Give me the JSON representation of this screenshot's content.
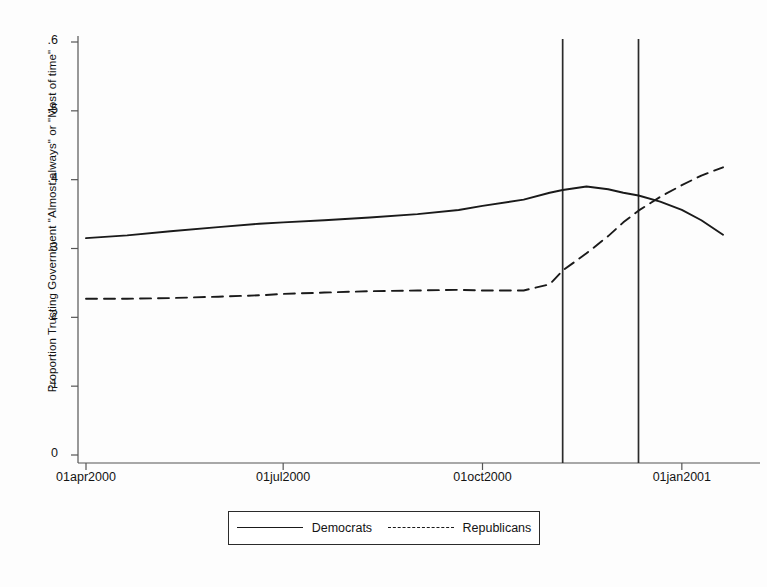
{
  "chart_data": {
    "type": "line",
    "title": "",
    "subtitle": "",
    "xlabel": "",
    "ylabel": "Proportion Trusting Government \"Almost always\" or \"Most of time\"",
    "ylim": [
      0,
      0.6
    ],
    "ytick_labels": [
      "0",
      ".1",
      ".2",
      ".3",
      ".4",
      ".5",
      ".6"
    ],
    "ytick_values": [
      0,
      0.1,
      0.2,
      0.3,
      0.4,
      0.5,
      0.6
    ],
    "xtick_labels": [
      "01apr2000",
      "01jul2000",
      "01oct2000",
      "01jan2001"
    ],
    "xtick_values": [
      "2000-04-01",
      "2000-07-01",
      "2000-10-01",
      "2001-01-01"
    ],
    "xlim": [
      "2000-04-01",
      "2001-01-20"
    ],
    "grid": false,
    "legend_position": "bottom-outside",
    "legend": [
      "Democrats",
      "Republicans"
    ],
    "annotations": [
      {
        "type": "vertical-line",
        "label": "election-day-reference-line",
        "x": "2000-11-07"
      },
      {
        "type": "vertical-line",
        "label": "recount-resolution-reference-line",
        "x": "2000-12-12"
      }
    ],
    "series": [
      {
        "name": "Democrats",
        "style": "solid",
        "color": "#1a1a1a",
        "x": [
          "2000-04-01",
          "2000-04-20",
          "2000-05-10",
          "2000-06-01",
          "2000-06-20",
          "2000-07-01",
          "2000-07-20",
          "2000-08-10",
          "2000-09-01",
          "2000-09-20",
          "2000-10-01",
          "2000-10-20",
          "2000-11-01",
          "2000-11-07",
          "2000-11-18",
          "2000-11-28",
          "2000-12-05",
          "2000-12-12",
          "2000-12-22",
          "2001-01-01",
          "2001-01-10",
          "2001-01-20"
        ],
        "values": [
          0.315,
          0.319,
          0.325,
          0.331,
          0.336,
          0.338,
          0.341,
          0.345,
          0.35,
          0.356,
          0.362,
          0.371,
          0.381,
          0.385,
          0.39,
          0.386,
          0.381,
          0.377,
          0.368,
          0.356,
          0.341,
          0.32
        ]
      },
      {
        "name": "Republicans",
        "style": "dashed",
        "color": "#1a1a1a",
        "x": [
          "2000-04-01",
          "2000-04-20",
          "2000-05-10",
          "2000-06-01",
          "2000-06-20",
          "2000-07-01",
          "2000-07-20",
          "2000-08-10",
          "2000-09-01",
          "2000-09-20",
          "2000-10-01",
          "2000-10-20",
          "2000-11-01",
          "2000-11-07",
          "2000-11-18",
          "2000-11-28",
          "2000-12-05",
          "2000-12-12",
          "2000-12-22",
          "2001-01-01",
          "2001-01-10",
          "2001-01-20"
        ],
        "values": [
          0.227,
          0.227,
          0.228,
          0.23,
          0.232,
          0.234,
          0.236,
          0.238,
          0.239,
          0.24,
          0.239,
          0.239,
          0.248,
          0.268,
          0.293,
          0.318,
          0.338,
          0.355,
          0.375,
          0.392,
          0.406,
          0.418
        ]
      }
    ]
  },
  "legend": {
    "democrats": "Democrats",
    "republicans": "Republicans"
  }
}
